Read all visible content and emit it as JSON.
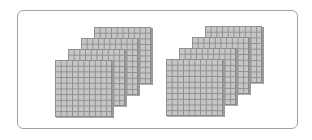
{
  "diagram": {
    "colors": {
      "frame_border": "#a4a4a4",
      "flat_fill": "#c6c6c6",
      "grid_line": "#8e8e8e",
      "flat_side": "#9a9a9a",
      "background": "#ffffff"
    },
    "grid": {
      "rows": 10,
      "cols": 10
    },
    "groups": [
      {
        "name": "left-group",
        "flat_count": 4,
        "flats": [
          {
            "x": 94,
            "y": 27
          },
          {
            "x": 81,
            "y": 38
          },
          {
            "x": 68,
            "y": 49
          },
          {
            "x": 55,
            "y": 60
          }
        ]
      },
      {
        "name": "right-group",
        "flat_count": 4,
        "flats": [
          {
            "x": 205,
            "y": 26
          },
          {
            "x": 192,
            "y": 37
          },
          {
            "x": 179,
            "y": 48
          },
          {
            "x": 166,
            "y": 59
          }
        ]
      }
    ]
  }
}
